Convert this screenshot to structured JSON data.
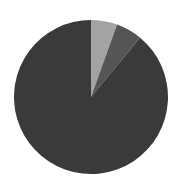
{
  "chart_data": {
    "type": "pie",
    "title": "",
    "labels": [
      "",
      "",
      ""
    ],
    "values": [
      5.5,
      5.5,
      89
    ],
    "colors": [
      "#a3a3a3",
      "#555555",
      "#3a3a3a"
    ],
    "start_angle_deg": 0,
    "direction": "clockwise",
    "legend": "none",
    "center": [
      91,
      97
    ],
    "radius": 77
  },
  "background": "#ffffff"
}
